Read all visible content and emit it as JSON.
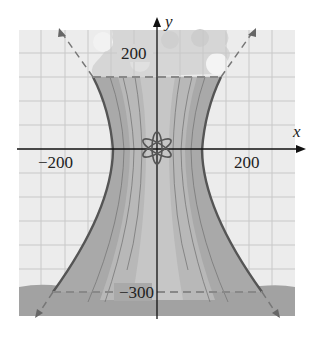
{
  "diagram": {
    "type": "hyperbola-cooling-tower",
    "axes": {
      "x_label": "x",
      "y_label": "y",
      "x_ticks": [
        {
          "value": -200,
          "label": "−200"
        },
        {
          "value": 200,
          "label": "200"
        }
      ],
      "y_ticks": [
        {
          "value": 200,
          "label": "200"
        },
        {
          "value": -300,
          "label": "−300"
        }
      ]
    },
    "labels": {
      "y_top": "200",
      "y_bottom": "−300",
      "x_left": "−200",
      "x_right": "200",
      "x_axis": "x",
      "y_axis": "y"
    },
    "elements": [
      "grid",
      "cooling-tower-fill",
      "hyperbola-branches",
      "asymptotes-dashed",
      "steam-clouds",
      "ground-band",
      "atom-symbol",
      "dashed-top-line-y200",
      "dashed-bottom-line-y-300"
    ],
    "colors": {
      "grid": "#c8c8c8",
      "background": "#ececec",
      "tower": "#a8a8a8",
      "tower_light": "#c4c4c4",
      "ground": "#9a9a9a",
      "curve": "#555555",
      "cloud": "#d9d9d9",
      "dash": "#777777"
    }
  }
}
